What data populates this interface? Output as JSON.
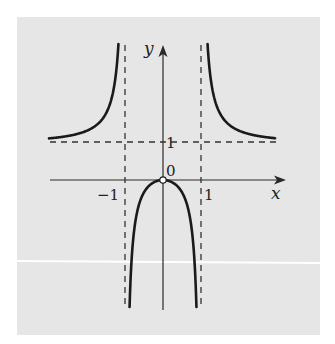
{
  "chart_data": {
    "type": "line",
    "title": "",
    "function": "y = x^2/(x^2-1)",
    "xlabel": "x",
    "ylabel": "y",
    "tick_labels": {
      "x": [
        "-1",
        "1"
      ],
      "y": [
        "1"
      ],
      "origin": "0"
    },
    "asymptotes": {
      "vertical": [
        -1,
        1
      ],
      "horizontal": [
        1
      ]
    },
    "open_point": {
      "x": 0,
      "y": 0
    },
    "xlim": [
      -3.0,
      3.25
    ],
    "ylim": [
      -3.5,
      3.65
    ],
    "grid": false,
    "legend": null,
    "series": [
      {
        "name": "left branch (x<-1)",
        "x": [
          -3.0,
          -2.5,
          -2.0,
          -1.6,
          -1.4,
          -1.3,
          -1.2,
          -1.17
        ],
        "y": [
          1.125,
          1.19,
          1.333,
          1.641,
          2.042,
          2.449,
          3.273,
          3.71
        ]
      },
      {
        "name": "middle branch (-1<x<1)",
        "x": [
          -0.88,
          -0.8,
          -0.6,
          -0.4,
          -0.2,
          0,
          0.2,
          0.4,
          0.6,
          0.8,
          0.88
        ],
        "y": [
          -3.44,
          -1.778,
          -0.5625,
          -0.19,
          -0.042,
          0,
          -0.042,
          -0.19,
          -0.5625,
          -1.778,
          -3.44
        ]
      },
      {
        "name": "right branch (x>1)",
        "x": [
          1.17,
          1.2,
          1.3,
          1.4,
          1.6,
          2.0,
          2.5,
          3.0
        ],
        "y": [
          3.71,
          3.273,
          2.449,
          2.042,
          1.641,
          1.333,
          1.19,
          1.125
        ]
      }
    ]
  },
  "labels": {
    "x_axis": "x",
    "y_axis": "y",
    "origin": "0",
    "tick_neg1": "−1",
    "tick_pos1": "1",
    "tick_y1": "1"
  },
  "colors": {
    "background": "#e6e6e6",
    "curve": "#1a1a1a",
    "axis": "#2a2a2a",
    "dashes": "#333333"
  }
}
